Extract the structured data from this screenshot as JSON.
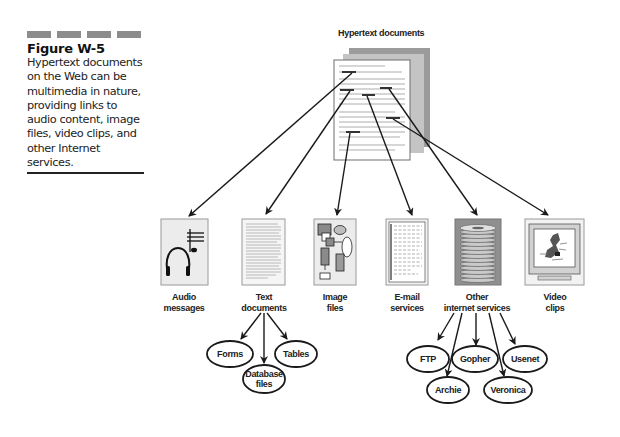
{
  "caption": {
    "figure_title": "Figure W-5",
    "text_lines": [
      "Hypertext documents",
      "on the Web can be",
      "multimedia in nature,",
      "providing links to",
      "audio content, image",
      "files, video clips, and",
      "other Internet",
      "services."
    ]
  },
  "diagram": {
    "source_title": "Hypertext documents",
    "targets": [
      {
        "id": "audio",
        "label_lines": [
          "Audio",
          "messages"
        ],
        "icon": "headphones-music-icon"
      },
      {
        "id": "text",
        "label_lines": [
          "Text",
          "documents"
        ],
        "icon": "text-page-icon"
      },
      {
        "id": "image",
        "label_lines": [
          "Image",
          "files"
        ],
        "icon": "image-shapes-icon"
      },
      {
        "id": "email",
        "label_lines": [
          "E-mail",
          "services"
        ],
        "icon": "email-page-icon"
      },
      {
        "id": "other",
        "label_lines": [
          "Other",
          "internet services"
        ],
        "icon": "disk-stack-icon"
      },
      {
        "id": "video",
        "label_lines": [
          "Video",
          "clips"
        ],
        "icon": "monitor-video-icon"
      }
    ],
    "text_subtypes": [
      {
        "label_lines": [
          "Forms"
        ]
      },
      {
        "label_lines": [
          "Database",
          "files"
        ]
      },
      {
        "label_lines": [
          "Tables"
        ]
      }
    ],
    "internet_subtypes": [
      {
        "label_lines": [
          "FTP"
        ]
      },
      {
        "label_lines": [
          "Gopher"
        ]
      },
      {
        "label_lines": [
          "Usenet"
        ]
      },
      {
        "label_lines": [
          "Archie"
        ]
      },
      {
        "label_lines": [
          "Veronica"
        ]
      }
    ]
  },
  "colors": {
    "line": "#1a1a1a",
    "box_fill": "#ececec",
    "box_border": "#9a9a9a",
    "caption_bars": "#8c8c8c"
  }
}
